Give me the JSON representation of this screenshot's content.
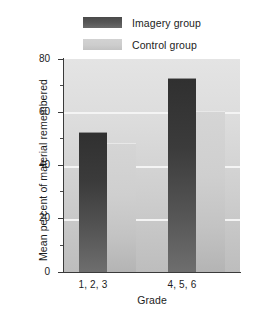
{
  "chart_data": {
    "type": "bar",
    "title": "",
    "xlabel": "Grade",
    "ylabel": "Mean percent of material remembered",
    "categories": [
      "1, 2, 3",
      "4, 5, 6"
    ],
    "series": [
      {
        "name": "Imagery group",
        "color": "#3b3b3b",
        "values": [
          52.5,
          73.0
        ]
      },
      {
        "name": "Control group",
        "color": "#cfcfcf",
        "values": [
          48.5,
          60.5
        ]
      }
    ],
    "ylim": [
      0,
      80
    ],
    "ytick_labels": [
      "0",
      "20",
      "40",
      "60",
      "80"
    ],
    "ytick_values": [
      0,
      20,
      40,
      60,
      80
    ],
    "yminor_values": [
      10,
      30,
      50,
      70
    ],
    "gridlines": [
      20,
      40,
      60
    ],
    "grid": true,
    "legend_position": "top"
  },
  "legend": {
    "items": [
      {
        "label": "Imagery group",
        "swatch": "dark-gray-swatch"
      },
      {
        "label": "Control group",
        "swatch": "light-gray-swatch"
      }
    ]
  },
  "axes": {
    "y_title": "Mean percent of material remembered",
    "x_title": "Grade",
    "y_ticks": [
      "80",
      "60",
      "40",
      "20",
      "0"
    ],
    "x_ticks": [
      "1, 2, 3",
      "4, 5, 6"
    ]
  }
}
